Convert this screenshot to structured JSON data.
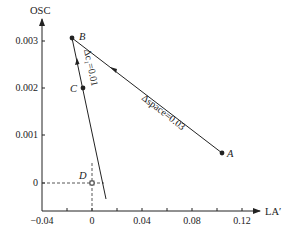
{
  "axes": {
    "y_title": "OSC",
    "x_title": "LA′",
    "y_ticks": [
      "0.003",
      "0.002",
      "0.001",
      "0"
    ],
    "x_ticks": [
      "−0.04",
      "0",
      "0.04",
      "0.08",
      "0.12"
    ]
  },
  "points": {
    "A": "A",
    "B": "B",
    "C": "C",
    "D": "D"
  },
  "lines": {
    "BA_label": "Δspace=0.03",
    "BC_label": "Δc₁=0.01"
  },
  "colors": {
    "ink": "#222222",
    "background": "#ffffff"
  }
}
